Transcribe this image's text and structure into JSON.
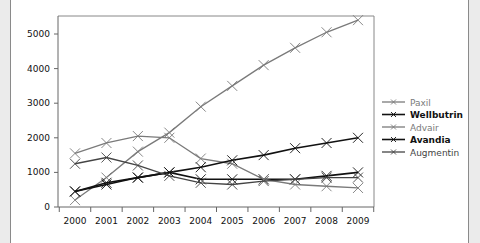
{
  "chart_data": {
    "type": "line",
    "title": "",
    "xlabel": "",
    "ylabel": "",
    "x": [
      "2000",
      "2001",
      "2002",
      "2003",
      "2004",
      "2005",
      "2006",
      "2007",
      "2008",
      "2009"
    ],
    "ylim": [
      0,
      5500
    ],
    "yticks": [
      0,
      1000,
      2000,
      3000,
      4000,
      5000
    ],
    "grid": false,
    "legend_position": "right",
    "series": [
      {
        "name": "Paxil",
        "color": "#7a7a7a",
        "bold": false,
        "values": [
          200,
          850,
          1600,
          2150,
          2900,
          3500,
          4100,
          4600,
          5050,
          5400
        ]
      },
      {
        "name": "Wellbutrin",
        "color": "#111111",
        "bold": true,
        "values": [
          450,
          650,
          850,
          1000,
          800,
          800,
          800,
          800,
          900,
          1000
        ]
      },
      {
        "name": "Advair",
        "color": "#7a7a7a",
        "bold": false,
        "values": [
          1550,
          1850,
          2050,
          2000,
          1400,
          1250,
          800,
          650,
          600,
          550
        ]
      },
      {
        "name": "Avandia",
        "color": "#111111",
        "bold": true,
        "values": [
          450,
          700,
          850,
          1000,
          1150,
          1350,
          1500,
          1700,
          1850,
          2000
        ]
      },
      {
        "name": "Augmentin",
        "color": "#444444",
        "bold": false,
        "values": [
          1250,
          1430,
          1200,
          900,
          700,
          650,
          750,
          800,
          850,
          850
        ]
      }
    ]
  }
}
